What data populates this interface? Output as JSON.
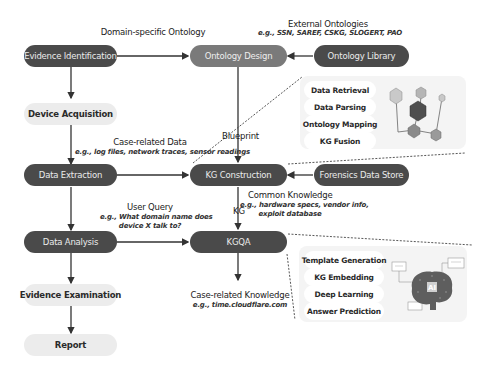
{
  "nodes": {
    "evidence_identification": "Evidence Identification",
    "device_acquisition": "Device Acquisition",
    "data_extraction": "Data Extraction",
    "data_analysis": "Data Analysis",
    "evidence_examination": "Evidence Examination",
    "report": "Report",
    "ontology_design": "Ontology Design",
    "ontology_library": "Ontology Library",
    "kg_construction": "KG Construction",
    "forensics_data_store": "Forensics Data Store",
    "kgqa": "KGQA"
  },
  "labels": {
    "domain_ontology": "Domain-specific Ontology",
    "external_ontologies": "External Ontologies",
    "external_ontologies_eg": "e.g., SSN, SAREF, CSKG, SLOGERT, PAO",
    "blueprint": "Blueprint",
    "case_data": "Case-related Data",
    "case_data_eg": "e.g., log files, network traces, sensor readings",
    "common_knowledge": "Common Knowledge",
    "common_knowledge_eg_1": "e.g., hardware specs, vendor info,",
    "common_knowledge_eg_2": "exploit database",
    "kg": "KG",
    "user_query": "User Query",
    "user_query_eg_1": "e.g., What domain name does",
    "user_query_eg_2": "device X talk to?",
    "case_knowledge": "Case-related Knowledge",
    "case_knowledge_eg": "e.g., time.cloudflare.com"
  },
  "kg_construction_panel": {
    "steps": [
      "Data Retrieval",
      "Data Parsing",
      "Ontology Mapping",
      "KG Fusion"
    ],
    "illustration": "knowledge-graph-cubes"
  },
  "kgqa_panel": {
    "steps": [
      "Template Generation",
      "KG Embedding",
      "Deep Learning",
      "Answer Prediction"
    ],
    "illustration": "ai-brain",
    "ai_text": "AI"
  },
  "colors": {
    "dark_node": "#4a4a4a",
    "mid_node": "#7a7a7a",
    "light_node": "#ececec",
    "panel": "#f4f4f4"
  }
}
